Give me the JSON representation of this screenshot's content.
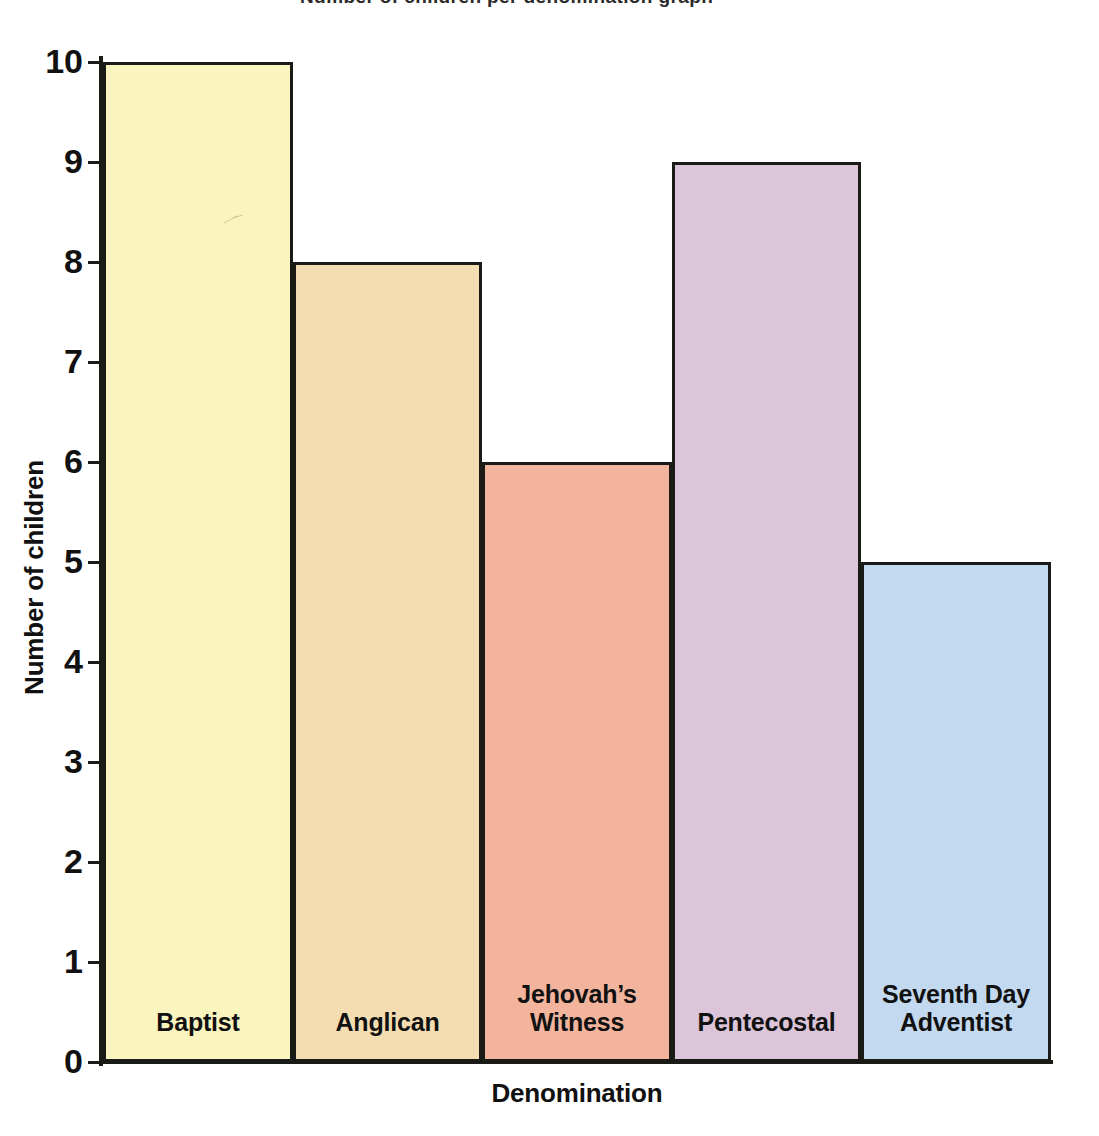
{
  "page": {
    "background_color": "#ffffff",
    "cropped_header_fragment": "Number of children per denomination graph"
  },
  "chart_data": {
    "type": "bar",
    "title": "",
    "subtitle": "",
    "xlabel": "Denomination",
    "ylabel": "Number of children",
    "categories": [
      "Baptist",
      "Anglican",
      "Jehovah’s\nWitness",
      "Pentecostal",
      "Seventh Day\nAdventist"
    ],
    "values": [
      10,
      8,
      6,
      9,
      5
    ],
    "ylim": [
      0,
      10
    ],
    "ytick_labels": [
      "0",
      "1",
      "2",
      "3",
      "4",
      "5",
      "6",
      "7",
      "8",
      "9",
      "10"
    ],
    "ytick_values": [
      0,
      1,
      2,
      3,
      4,
      5,
      6,
      7,
      8,
      9,
      10
    ],
    "grid": false,
    "legend": "none",
    "bar_colors": [
      "#faf4bf",
      "#f5ddb2",
      "#f3b49d",
      "#dcc4d9",
      "#c3d9ef"
    ],
    "bar_border_color": "#1a1a16",
    "axis_color": "#1a1a16",
    "label_position": "inside-bottom"
  }
}
